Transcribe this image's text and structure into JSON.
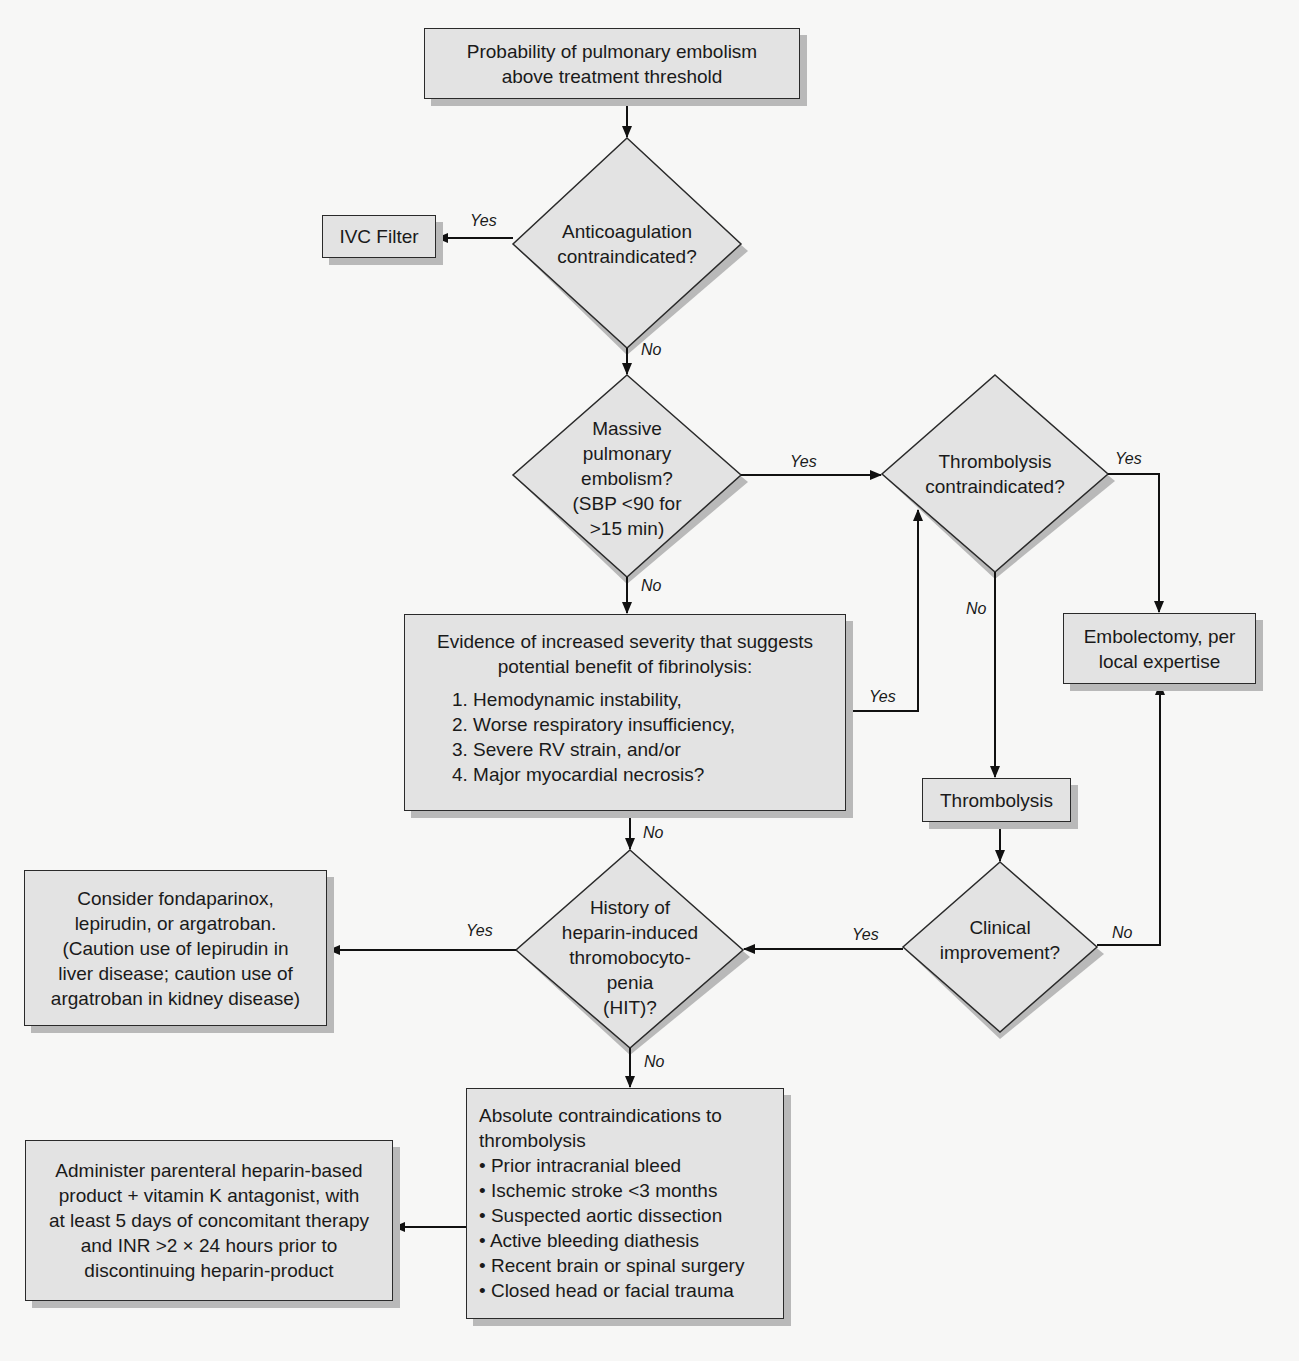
{
  "diagram": {
    "type": "flowchart",
    "colors": {
      "background": "#f7f7f6",
      "node_fill": "#e3e3e3",
      "node_border": "#2a2a2a",
      "shadow": "#b9b9b9",
      "connector": "#111111"
    }
  },
  "nodes": {
    "start": {
      "lines": [
        "Probability of pulmonary embolism",
        "above treatment threshold"
      ]
    },
    "anticoag_decision": {
      "lines": [
        "Anticoagulation",
        "contraindicated?"
      ]
    },
    "ivc_filter": {
      "lines": [
        "IVC Filter"
      ]
    },
    "massive_pe_decision": {
      "lines": [
        "Massive",
        "pulmonary",
        "embolism?",
        "(SBP <90 for",
        ">15 min)"
      ]
    },
    "thrombolysis_contra_decision": {
      "lines": [
        "Thrombolysis",
        "contraindicated?"
      ]
    },
    "embolectomy": {
      "lines": [
        "Embolectomy, per",
        "local expertise"
      ]
    },
    "severity_evidence": {
      "heading": [
        "Evidence of increased severity that suggests",
        "potential benefit of fibrinolysis:"
      ],
      "items": [
        "1. Hemodynamic instability,",
        "2. Worse respiratory insufficiency,",
        "3. Severe RV strain, and/or",
        "4. Major myocardial necrosis?"
      ]
    },
    "thrombolysis": {
      "lines": [
        "Thrombolysis"
      ]
    },
    "clinical_improvement_decision": {
      "lines": [
        "Clinical",
        "improvement?"
      ]
    },
    "hit_decision": {
      "lines": [
        "History of",
        "heparin-induced",
        "thromobocyto-",
        "penia",
        "(HIT)?"
      ]
    },
    "alt_anticoagulants": {
      "lines": [
        "Consider fondaparinox,",
        "lepirudin, or argatroban.",
        "(Caution use of lepirudin in",
        "liver disease; caution use of",
        "argatroban in kidney disease)"
      ]
    },
    "absolute_contraindications": {
      "heading": [
        "Absolute contraindications to",
        "thrombolysis"
      ],
      "items": [
        "• Prior intracranial bleed",
        "• Ischemic stroke <3 months",
        "• Suspected aortic dissection",
        "• Active bleeding diathesis",
        "• Recent brain or spinal surgery",
        "• Closed head or facial trauma"
      ]
    },
    "heparin_therapy": {
      "lines": [
        "Administer parenteral heparin-based",
        "product + vitamin K antagonist, with",
        "at least 5 days of concomitant therapy",
        "and INR >2 × 24 hours prior to",
        "discontinuing heparin-product"
      ]
    }
  },
  "edges": [
    {
      "from": "start",
      "to": "anticoag_decision",
      "label": ""
    },
    {
      "from": "anticoag_decision",
      "to": "ivc_filter",
      "label": "Yes"
    },
    {
      "from": "anticoag_decision",
      "to": "massive_pe_decision",
      "label": "No"
    },
    {
      "from": "massive_pe_decision",
      "to": "thrombolysis_contra_decision",
      "label": "Yes"
    },
    {
      "from": "massive_pe_decision",
      "to": "severity_evidence",
      "label": "No"
    },
    {
      "from": "severity_evidence",
      "to": "thrombolysis_contra_decision",
      "label": "Yes"
    },
    {
      "from": "severity_evidence",
      "to": "hit_decision",
      "label": "No"
    },
    {
      "from": "thrombolysis_contra_decision",
      "to": "embolectomy",
      "label": "Yes"
    },
    {
      "from": "thrombolysis_contra_decision",
      "to": "thrombolysis",
      "label": "No"
    },
    {
      "from": "thrombolysis",
      "to": "clinical_improvement_decision",
      "label": ""
    },
    {
      "from": "clinical_improvement_decision",
      "to": "embolectomy",
      "label": "No"
    },
    {
      "from": "clinical_improvement_decision",
      "to": "hit_decision",
      "label": "Yes"
    },
    {
      "from": "hit_decision",
      "to": "alt_anticoagulants",
      "label": "Yes"
    },
    {
      "from": "hit_decision",
      "to": "absolute_contraindications",
      "label": "No"
    },
    {
      "from": "absolute_contraindications",
      "to": "heparin_therapy",
      "label": ""
    }
  ],
  "edge_labels": {
    "yes": "Yes",
    "no": "No"
  }
}
